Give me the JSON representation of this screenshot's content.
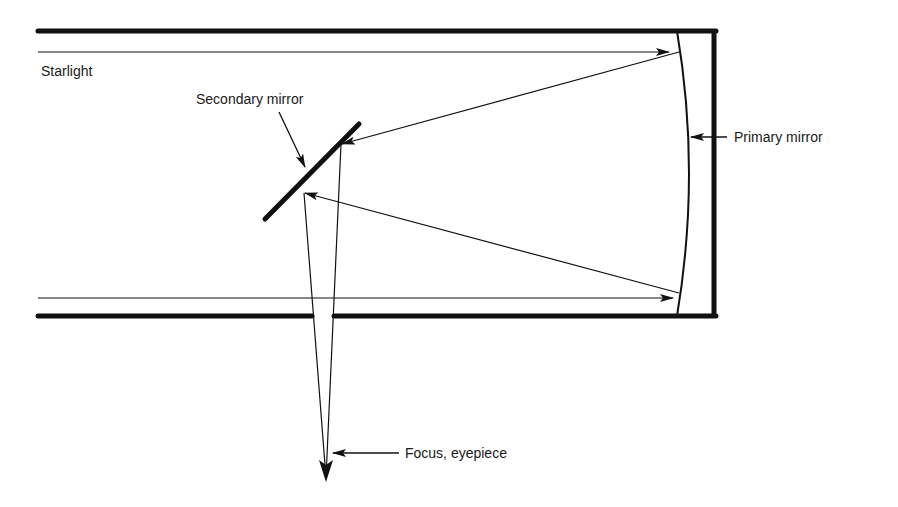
{
  "diagram": {
    "type": "reflecting-telescope-optics",
    "labels": {
      "starlight": "Starlight",
      "secondary_mirror": "Secondary mirror",
      "primary_mirror": "Primary mirror",
      "focus": "Focus, eyepiece"
    },
    "colors": {
      "ink": "#111111",
      "background": "#ffffff"
    }
  }
}
